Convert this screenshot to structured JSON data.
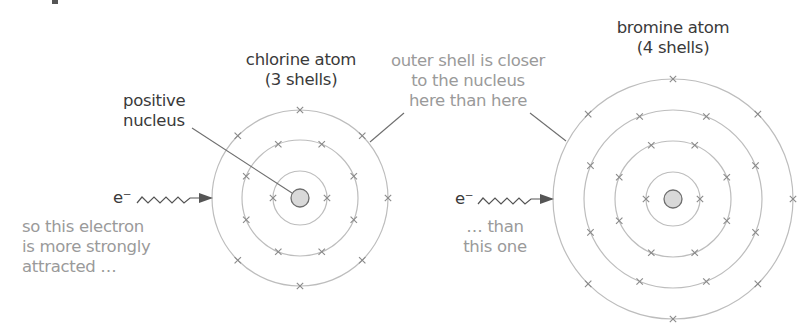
{
  "figure": {
    "colors": {
      "dark_text": "#3a3a3a",
      "grey_text": "#9a9a9a",
      "shell_stroke": "#bdbdbd",
      "electron_mark": "#8a8a8a",
      "nucleus_fill": "#d9d9d9",
      "nucleus_stroke": "#6e6e6e",
      "leader_line": "#6e6e6e",
      "arrow": "#555555"
    }
  },
  "chlorine": {
    "label_line1": "chlorine atom",
    "label_line2": "(3 shells)",
    "center": [
      300,
      198
    ],
    "nucleus_radius": 9,
    "shells": [
      {
        "radius": 27,
        "electrons": 2
      },
      {
        "radius": 58,
        "electrons": 8
      },
      {
        "radius": 88,
        "electrons": 7
      }
    ]
  },
  "bromine": {
    "label_line1": "bromine atom",
    "label_line2": "(4 shells)",
    "center": [
      673,
      199
    ],
    "nucleus_radius": 9,
    "shells": [
      {
        "radius": 27,
        "electrons": 2
      },
      {
        "radius": 58,
        "electrons": 8
      },
      {
        "radius": 89,
        "electrons": 8
      },
      {
        "radius": 120,
        "electrons": 7
      }
    ]
  },
  "annotations": {
    "positive_nucleus_line1": "positive",
    "positive_nucleus_line2": "nucleus",
    "outer_shell_line1": "outer shell is closer",
    "outer_shell_line2": "to the nucleus",
    "outer_shell_line3": "here than here",
    "left_electron_label": "e⁻",
    "right_electron_label": "e⁻",
    "left_caption_line1": "so this electron",
    "left_caption_line2": "is more strongly",
    "left_caption_line3": "attracted …",
    "right_caption_line1": "… than",
    "right_caption_line2": "this one"
  }
}
